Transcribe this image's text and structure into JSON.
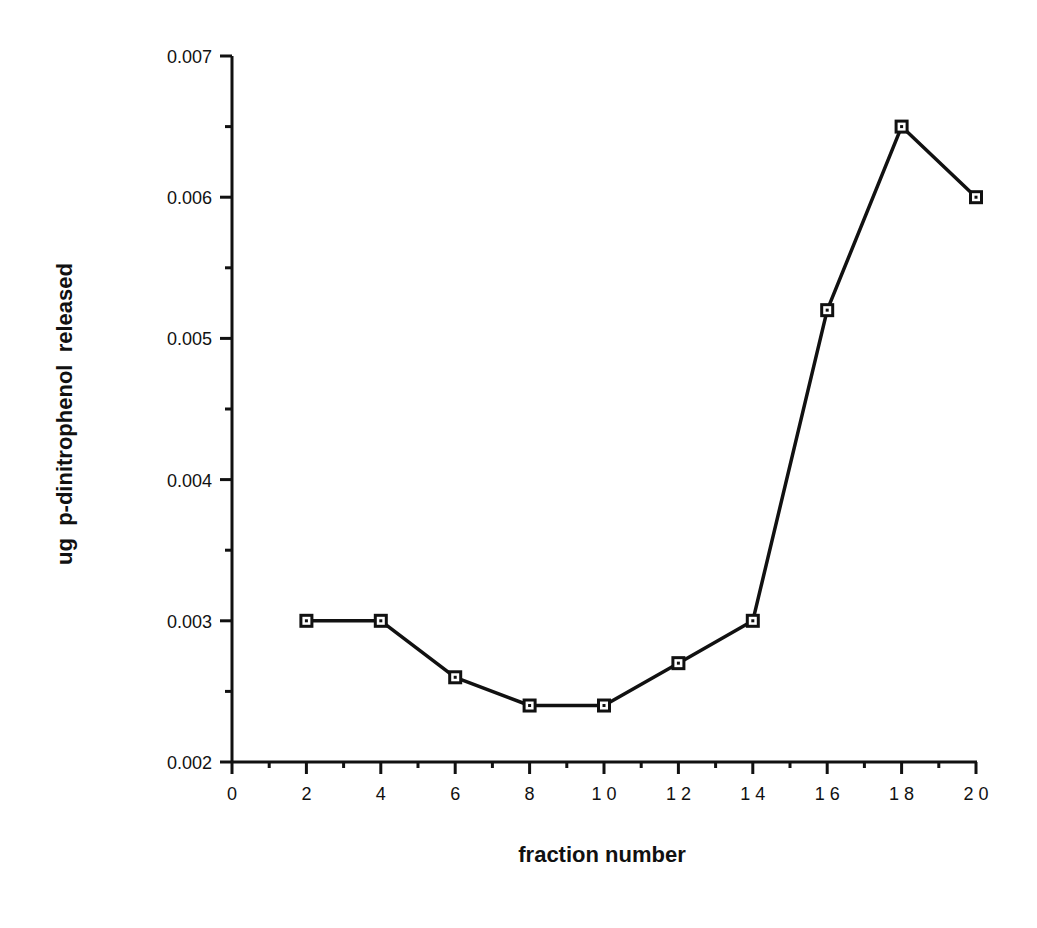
{
  "chart_data": {
    "type": "line",
    "title": "",
    "xlabel": "fraction number",
    "ylabel": "ug  p-dinitrophenol  released",
    "xlim": [
      0,
      20
    ],
    "ylim": [
      0.002,
      0.007
    ],
    "x_ticks": [
      0,
      2,
      4,
      6,
      8,
      10,
      12,
      14,
      16,
      18,
      20
    ],
    "x_tick_labels": [
      "0",
      "2",
      "4",
      "6",
      "8",
      "1 0",
      "1 2",
      "1 4",
      "1 6",
      "1 8",
      "2 0"
    ],
    "y_ticks": [
      0.002,
      0.003,
      0.004,
      0.005,
      0.006,
      0.007
    ],
    "y_tick_labels": [
      "0.002",
      "0.003",
      "0.004",
      "0.005",
      "0.006",
      "0.007"
    ],
    "grid": false,
    "legend": null,
    "marker": "open-square",
    "series": [
      {
        "name": "p-dinitrophenol released",
        "x": [
          2,
          4,
          6,
          8,
          10,
          12,
          14,
          16,
          18,
          20
        ],
        "values": [
          0.003,
          0.003,
          0.0026,
          0.0024,
          0.0024,
          0.0027,
          0.003,
          0.0052,
          0.0065,
          0.006
        ]
      }
    ]
  }
}
